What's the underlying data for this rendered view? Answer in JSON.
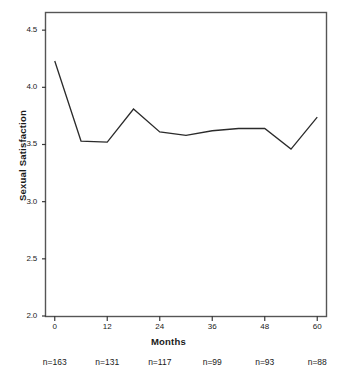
{
  "chart_data": {
    "type": "line",
    "title": "",
    "xlabel": "Months",
    "ylabel": "Sexual Satisfaction",
    "xlim": [
      -2,
      62
    ],
    "ylim": [
      2.0,
      4.65
    ],
    "grid": false,
    "legend": null,
    "x": [
      0,
      6,
      12,
      18,
      24,
      30,
      36,
      42,
      48,
      54,
      60
    ],
    "values": [
      4.23,
      3.53,
      3.52,
      3.81,
      3.61,
      3.58,
      3.62,
      3.64,
      3.64,
      3.46,
      3.74
    ],
    "series": [
      {
        "name": "Sexual Satisfaction",
        "values": [
          4.23,
          3.53,
          3.52,
          3.81,
          3.61,
          3.58,
          3.62,
          3.64,
          3.64,
          3.46,
          3.74
        ]
      }
    ],
    "x_ticks": [
      0,
      12,
      24,
      36,
      48,
      60
    ],
    "x_tick_labels": [
      "0",
      "12",
      "24",
      "36",
      "48",
      "60"
    ],
    "y_ticks": [
      2.0,
      2.5,
      3.0,
      3.5,
      4.0,
      4.5
    ],
    "y_tick_labels": [
      "2.0",
      "2.5",
      "3.0",
      "3.5",
      "4.0",
      "4.5"
    ],
    "line_color": "#2b2b2b",
    "plot_border_color": "#555555",
    "background_color": "#ffffff",
    "annotations": {
      "sample_sizes": [
        {
          "label": "n=163",
          "x": 0
        },
        {
          "label": "n=131",
          "x": 12
        },
        {
          "label": "n=117",
          "x": 24
        },
        {
          "label": "n=99",
          "x": 36
        },
        {
          "label": "n=93",
          "x": 48
        },
        {
          "label": "n=88",
          "x": 60
        }
      ]
    }
  }
}
